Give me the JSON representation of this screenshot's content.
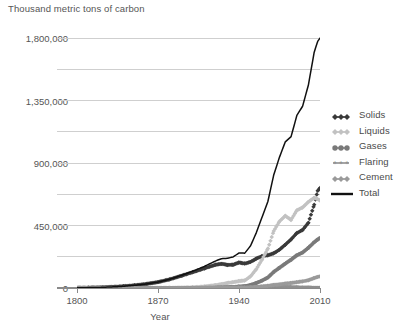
{
  "chart_data": {
    "type": "line",
    "title": "Thousand metric tons of carbon",
    "subtitle": "",
    "xlabel": "Year",
    "ylabel": "Thousand metric tons of carbon",
    "xlim": [
      1800,
      2010
    ],
    "ylim": [
      0,
      1800000
    ],
    "xticks": [
      1800,
      1870,
      1940,
      2010
    ],
    "xtick_labels": [
      "1800",
      "1870",
      "1940",
      "2010"
    ],
    "yticks": [
      0,
      450000,
      900000,
      1350000,
      1800000
    ],
    "ytick_labels": [
      "0",
      "450,000",
      "900,000",
      "1,350,000",
      "1,800,000"
    ],
    "minor_gridlines": [
      225000,
      675000,
      1125000,
      1575000
    ],
    "grid": true,
    "legend_position": "right",
    "x": [
      1800,
      1810,
      1820,
      1830,
      1840,
      1850,
      1860,
      1870,
      1880,
      1890,
      1900,
      1910,
      1920,
      1925,
      1930,
      1935,
      1940,
      1945,
      1950,
      1955,
      1960,
      1965,
      1970,
      1975,
      1980,
      1985,
      1990,
      1995,
      2000,
      2005,
      2008,
      2010
    ],
    "series": [
      {
        "name": "Solids",
        "marker": "diamond",
        "color": "#3a3a3a",
        "values": [
          8,
          14,
          22,
          38,
          62,
          97,
          147,
          212,
          310,
          437,
          570,
          705,
          840,
          870,
          830,
          840,
          920,
          880,
          940,
          1060,
          1150,
          1180,
          1250,
          1380,
          1560,
          1750,
          1980,
          2090,
          2350,
          3000,
          3500,
          3600
        ]
      },
      {
        "name": "Liquids",
        "marker": "diamond",
        "color": "#c2c2c2",
        "values": [
          0,
          0,
          0,
          0,
          0,
          0,
          0,
          1,
          3,
          10,
          26,
          54,
          105,
          140,
          180,
          210,
          250,
          270,
          420,
          680,
          1030,
          1420,
          2050,
          2400,
          2600,
          2450,
          2800,
          2900,
          3100,
          3250,
          3200,
          3150
        ]
      },
      {
        "name": "Gases",
        "marker": "circle",
        "color": "#7a7a7a",
        "values": [
          0,
          0,
          0,
          0,
          0,
          0,
          0,
          0,
          0,
          1,
          3,
          8,
          17,
          24,
          33,
          40,
          55,
          70,
          110,
          180,
          270,
          380,
          580,
          730,
          880,
          1020,
          1180,
          1280,
          1450,
          1650,
          1750,
          1800
        ]
      },
      {
        "name": "Flaring",
        "marker": "asterisk",
        "color": "#8f8f8f",
        "values": [
          0,
          0,
          0,
          0,
          0,
          0,
          0,
          0,
          0,
          0,
          1,
          2,
          5,
          7,
          10,
          12,
          16,
          18,
          23,
          35,
          48,
          62,
          78,
          72,
          62,
          48,
          42,
          38,
          34,
          30,
          28,
          27
        ]
      },
      {
        "name": "Cement",
        "marker": "diamond",
        "color": "#9a9a9a",
        "values": [
          0,
          0,
          0,
          0,
          0,
          0,
          0,
          0,
          1,
          2,
          4,
          7,
          11,
          14,
          17,
          18,
          21,
          17,
          27,
          40,
          60,
          80,
          110,
          130,
          160,
          180,
          210,
          240,
          280,
          360,
          400,
          420
        ]
      },
      {
        "name": "Total",
        "marker": "line",
        "color": "#111111",
        "values": [
          8,
          14,
          22,
          38,
          62,
          97,
          147,
          213,
          314,
          450,
          604,
          776,
          978,
          1055,
          1070,
          1120,
          1262,
          1255,
          1520,
          1995,
          2558,
          3122,
          4068,
          4712,
          5262,
          5448,
          6212,
          6548,
          7314,
          8490,
          8878,
          8997
        ]
      }
    ],
    "units_note": "values in millions of metric tons of carbon (scaled ×200 on axis)"
  },
  "legend": {
    "items": [
      {
        "label": "Solids",
        "marker": "diamond-dark"
      },
      {
        "label": "Liquids",
        "marker": "diamond-light"
      },
      {
        "label": "Gases",
        "marker": "circle-dark"
      },
      {
        "label": "Flaring",
        "marker": "asterisk-gray"
      },
      {
        "label": "Cement",
        "marker": "diamond-gray"
      },
      {
        "label": "Total",
        "marker": "line-black"
      }
    ]
  },
  "colors": {
    "solids": "#3a3a3a",
    "liquids": "#c2c2c2",
    "gases": "#7a7a7a",
    "flaring": "#8f8f8f",
    "cement": "#9a9a9a",
    "total": "#111111",
    "grid": "#cfcfcf",
    "axis": "#8a8a8a",
    "text": "#555555",
    "background": "#ffffff"
  }
}
